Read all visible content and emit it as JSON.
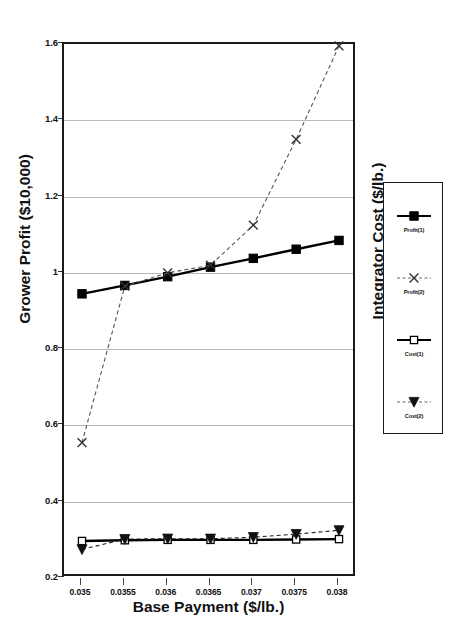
{
  "chart_data": {
    "type": "line",
    "title": "",
    "xlabel": "Base Payment ($/lb.)",
    "ylabel": "Grower Profit ($10,000)",
    "ylabel_secondary": "Integrator Cost ($/lb.)",
    "x": [
      0.035,
      0.0355,
      0.036,
      0.0365,
      0.037,
      0.0375,
      0.038
    ],
    "categories": [
      "0.035",
      "0.0355",
      "0.036",
      "0.0365",
      "0.037",
      "0.0375",
      "0.038"
    ],
    "ylim": [
      0.2,
      1.6
    ],
    "yticks": [
      0.2,
      0.4,
      0.6,
      0.8,
      1.0,
      1.2,
      1.4,
      1.6
    ],
    "ytick_labels": [
      "0.2",
      "0.4",
      "0.6",
      "0.8",
      "1",
      "1.2",
      "1.4",
      "1.6"
    ],
    "grid": true,
    "legend_position": "right-outside",
    "series": [
      {
        "name": "Profit(1)",
        "marker": "filled-square",
        "line_style": "solid",
        "color": "#000000",
        "values": [
          0.945,
          0.967,
          0.99,
          1.015,
          1.038,
          1.062,
          1.085
        ]
      },
      {
        "name": "Profit(2)",
        "marker": "x-cross",
        "line_style": "dashed",
        "color": "#555555",
        "values": [
          0.555,
          0.965,
          1.0,
          1.02,
          1.125,
          1.35,
          1.595
        ]
      },
      {
        "name": "Cost(1)",
        "marker": "open-square",
        "line_style": "solid",
        "color": "#000000",
        "values": [
          0.297,
          0.299,
          0.3,
          0.3,
          0.3,
          0.301,
          0.302
        ]
      },
      {
        "name": "Cost(2)",
        "marker": "filled-triangle-down",
        "line_style": "dashed",
        "color": "#222222",
        "values": [
          0.275,
          0.302,
          0.303,
          0.303,
          0.307,
          0.315,
          0.325
        ]
      }
    ]
  },
  "legend": {
    "entries": [
      {
        "label": "Profit(1)"
      },
      {
        "label": "Profit(2)"
      },
      {
        "label": "Cost(1)"
      },
      {
        "label": "Cost(2)"
      }
    ]
  },
  "colors": {
    "axis": "#1a1a1a",
    "grid": "#b9b9b9",
    "series_primary": "#000000",
    "series_dashed": "#555555",
    "background": "#ffffff"
  }
}
